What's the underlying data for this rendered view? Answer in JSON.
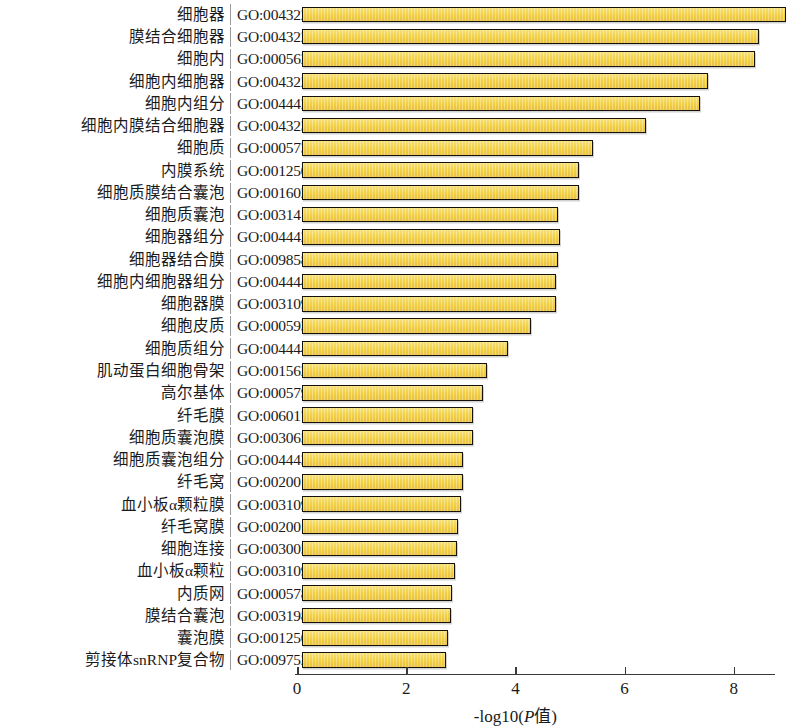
{
  "chart_data": {
    "type": "bar",
    "orientation": "horizontal",
    "title": "",
    "xlabel": "-log10(P值)",
    "xlabel_parts": {
      "prefix": "-log10(",
      "italic": "P",
      "cn": "值",
      "suffix": ")"
    },
    "ylabel": "",
    "xlim": [
      0,
      8.75
    ],
    "xticks": [
      0,
      2,
      4,
      6,
      8
    ],
    "xticklabels": [
      "0",
      "2",
      "4",
      "6",
      "8"
    ],
    "grid": false,
    "legend": null,
    "bar_color": "#f3d34c",
    "bar_edge_color": "#16120a",
    "categories": [
      "细胞器",
      "膜结合细胞器",
      "细胞内",
      "细胞内细胞器",
      "细胞内组分",
      "细胞内膜结合细胞器",
      "细胞质",
      "内膜系统",
      "细胞质膜结合囊泡",
      "细胞质囊泡",
      "细胞器组分",
      "细胞器结合膜",
      "细胞内细胞器组分",
      "细胞器膜",
      "细胞皮质",
      "细胞质组分",
      "肌动蛋白细胞骨架",
      "高尔基体",
      "纤毛膜",
      "细胞质囊泡膜",
      "细胞质囊泡组分",
      "纤毛窝",
      "血小板α颗粒膜",
      "纤毛窝膜",
      "细胞连接",
      "血小板α颗粒",
      "内质网",
      "膜结合囊泡",
      "囊泡膜",
      "剪接体snRNP复合物"
    ],
    "go_ids": [
      "GO:0043226",
      "GO:0043227",
      "GO:0005622",
      "GO:0043229",
      "GO:0044424",
      "GO:0043231",
      "GO:0005737",
      "GO:0012505",
      "GO:0016023",
      "GO:0031410",
      "GO:0044422",
      "GO:0098588",
      "GO:0044446",
      "GO:0031090",
      "GO:0005938",
      "GO:0044444",
      "GO:0015629",
      "GO:0005794",
      "GO:0060170",
      "GO:0030659",
      "GO:0044433",
      "GO:0020016",
      "GO:0031092",
      "GO:0020018",
      "GO:0030054",
      "GO:0031091",
      "GO:0005783",
      "GO:0031988",
      "GO:0012506",
      "GO:0097525"
    ],
    "values": [
      8.75,
      8.26,
      8.19,
      7.33,
      7.18,
      6.19,
      5.22,
      4.96,
      4.96,
      4.58,
      4.62,
      4.58,
      4.54,
      4.54,
      4.08,
      3.66,
      3.28,
      3.21,
      3.02,
      3.02,
      2.84,
      2.84,
      2.8,
      2.75,
      2.73,
      2.69,
      2.64,
      2.62,
      2.57,
      2.53
    ]
  }
}
